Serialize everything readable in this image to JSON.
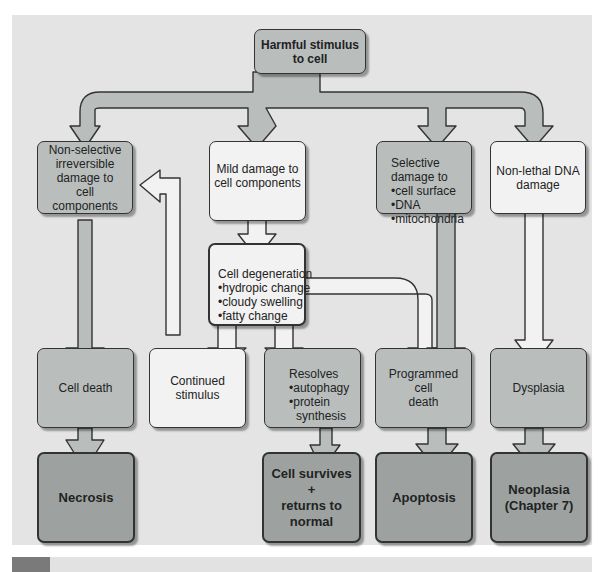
{
  "colors": {
    "background": "#e4e4e4",
    "medium_box": "#b9bebd",
    "light_box": "#f2f2f2",
    "dark_box": "#9da2a1",
    "arrow_dark": "#b9bebd",
    "arrow_light": "#f2f2f2",
    "outline": "#333333"
  },
  "nodes": {
    "harmful_stimulus": {
      "line1": "Harmful stimulus",
      "line2": "to cell"
    },
    "non_selective": {
      "line1": "Non-selective",
      "line2": "irreversible",
      "line3": "damage to",
      "line4": "cell components"
    },
    "mild_damage": {
      "line1": "Mild damage to",
      "line2": "cell components"
    },
    "selective_damage": {
      "title": "Selective",
      "title2": "damage to",
      "items": [
        "•cell surface",
        "•DNA",
        "•mitochondria"
      ]
    },
    "non_lethal_dna": {
      "line1": "Non-lethal DNA",
      "line2": "damage"
    },
    "cell_degeneration": {
      "title": "Cell degeneration",
      "items": [
        "•hydropic change",
        "•cloudy swelling",
        "•fatty change"
      ]
    },
    "cell_death": {
      "label": "Cell death"
    },
    "continued_stimulus": {
      "line1": "Continued",
      "line2": "stimulus"
    },
    "resolves": {
      "title": "Resolves",
      "items": [
        "•autophagy",
        "•protein",
        "  synthesis"
      ]
    },
    "programmed_cell_death": {
      "line1": "Programmed cell",
      "line2": "death"
    },
    "dysplasia": {
      "label": "Dysplasia"
    },
    "necrosis": {
      "label": "Necrosis"
    },
    "cell_survives": {
      "line1": "Cell survives",
      "line2": "+",
      "line3": "returns to",
      "line4": "normal"
    },
    "apoptosis": {
      "label": "Apoptosis"
    },
    "neoplasia": {
      "line1": "Neoplasia",
      "line2": "(Chapter 7)"
    }
  }
}
